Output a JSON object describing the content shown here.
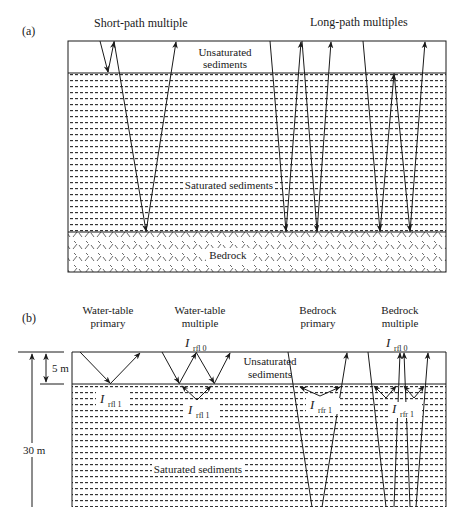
{
  "panel_a": {
    "label": "(a)",
    "titles": {
      "short_path": "Short-path multiple",
      "long_path": "Long-path multiples"
    },
    "layers": {
      "unsaturated_line1": "Unsaturated",
      "unsaturated_line2": "sediments",
      "saturated": "Saturated sediments",
      "bedrock": "Bedrock"
    }
  },
  "panel_b": {
    "label": "(b)",
    "titles": {
      "wt_primary_line1": "Water-table",
      "wt_primary_line2": "primary",
      "wt_multiple_line1": "Water-table",
      "wt_multiple_line2": "multiple",
      "br_primary_line1": "Bedrock",
      "br_primary_line2": "primary",
      "br_multiple_line1": "Bedrock",
      "br_multiple_line2": "multiple"
    },
    "layers": {
      "unsaturated_line1": "Unsaturated",
      "unsaturated_line2": "sediments",
      "saturated": "Saturated sediments"
    },
    "dimensions": {
      "small": "5 m",
      "large": "30 m"
    },
    "annotations": {
      "symbol": "I",
      "rfl0_sub": "rfl 0",
      "rfl1_sub": "rfl 1",
      "rfr1_sub": "rfr 1"
    }
  },
  "colors": {
    "line": "#1a1a1a",
    "pattern": "#333333",
    "background": "#ffffff"
  }
}
